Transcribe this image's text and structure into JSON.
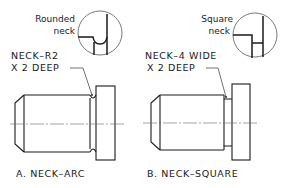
{
  "figure": {
    "panel_a": {
      "detail_label_line1": "Rounded",
      "detail_label_line2": "neck",
      "callout_line1": "NECK–R2",
      "callout_line2": "X 2 DEEP",
      "caption": "A.  NECK–ARC"
    },
    "panel_b": {
      "detail_label_line1": "Square",
      "detail_label_line2": "neck",
      "callout_line1": "NECK–4 WIDE",
      "callout_line2": "X 2 DEEP",
      "caption": "B.  NECK–SQUARE"
    }
  }
}
